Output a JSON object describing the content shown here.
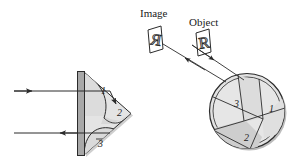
{
  "figure": {
    "name": "retroreflector-optics-diagram",
    "background_color": "#ffffff",
    "stroke_color": "#2b2b2b",
    "fill_light": "#e2e2e2",
    "fill_mid": "#d2d2d2",
    "fill_dark": "#b3b3b3",
    "fill_bar": "#a9a9a9"
  },
  "labels": {
    "image_caption": "Image",
    "object_caption": "Object",
    "image_glyph": "R",
    "object_glyph": "R"
  },
  "prism": {
    "regions": [
      {
        "id": "prism-region-1",
        "label": "1"
      },
      {
        "id": "prism-region-2",
        "label": "2"
      },
      {
        "id": "prism-region-3",
        "label": "3"
      }
    ]
  },
  "sphere": {
    "regions": [
      {
        "id": "sphere-region-1",
        "label": "1"
      },
      {
        "id": "sphere-region-2",
        "label": "2"
      },
      {
        "id": "sphere-region-3",
        "label": "3"
      }
    ]
  },
  "rays": {
    "incoming_left": "incoming ray arrow pointing right",
    "outgoing_left": "outgoing ray arrow pointing left",
    "object_to_sphere": "ray from object arrow pointing down-right",
    "sphere_to_image": "ray to image arrow pointing up-left"
  }
}
